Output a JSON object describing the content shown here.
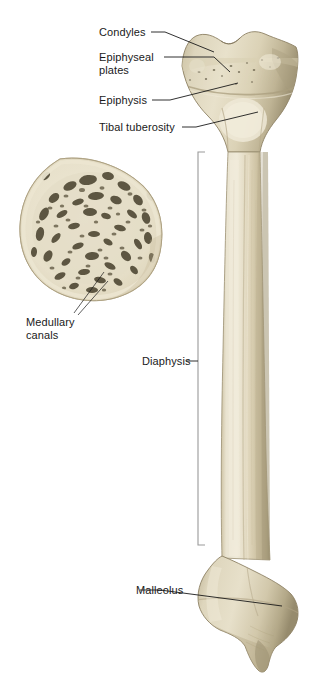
{
  "figure": {
    "background_color": "#ffffff",
    "labels": {
      "condyles": "Condyles",
      "epiphyseal_plates": "Epiphyseal plates",
      "epiphysis": "Epiphysis",
      "tibal_tuberosity": "Tibal tuberosity",
      "medullary_canals": "Medullary canals",
      "diaphysis": "Diaphysis",
      "malleolus": "Malleolus"
    },
    "colors": {
      "bone_light": "#e6dfc9",
      "bone_mid": "#d6ccb0",
      "bone_shadow": "#b5a98a",
      "bone_dark_edge": "#8d8164",
      "cortical_rim": "#e9e2cc",
      "trabecular_cavity": "#5d5642",
      "leader_line": "#1a1a1a",
      "bracket_line": "#9a9a9a",
      "text": "#1a1a1a"
    },
    "parts": {
      "proximal_epiphysis": "flared tibial condyles with intercondylar notch",
      "shaft": "long diaphysis of tibia",
      "distal_epiphysis": "distal end with medial malleolus",
      "cross_section": "transverse section of diaphysis showing spongy bone and medullary canals"
    }
  }
}
